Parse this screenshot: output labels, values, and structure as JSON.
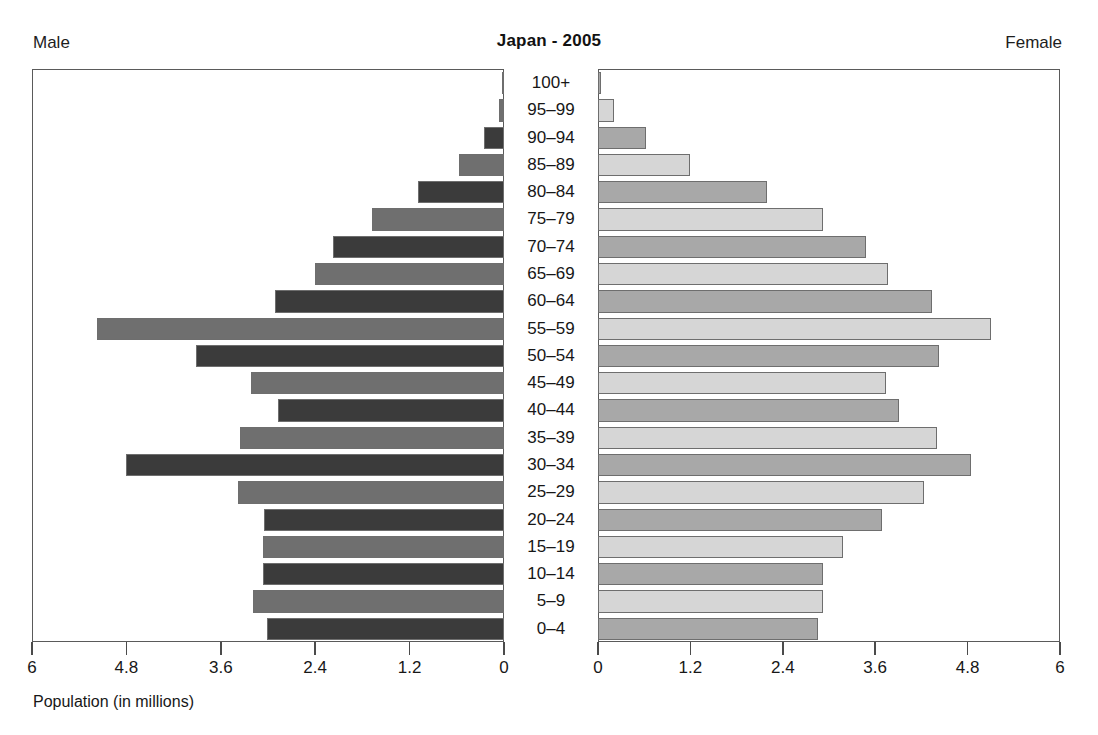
{
  "header": {
    "male_label": "Male",
    "female_label": "Female",
    "title": "Japan - 2005"
  },
  "axis": {
    "caption": "Population (in millions)",
    "male_ticks": [
      "6",
      "4.8",
      "3.6",
      "2.4",
      "1.2",
      "0"
    ],
    "female_ticks": [
      "0",
      "1.2",
      "2.4",
      "3.6",
      "4.8",
      "6"
    ],
    "max": 6,
    "tick_step": 1.2
  },
  "colors": {
    "male_dark": "#3b3b3b",
    "male_mid": "#6f6f6f",
    "female_mid": "#a8a8a8",
    "female_light": "#d6d6d6",
    "frame": "#5a5a5a",
    "text": "#171717",
    "background": "#ffffff"
  },
  "chart_data": {
    "type": "bar",
    "subtype": "population-pyramid",
    "title": "Japan - 2005",
    "xlabel": "Population (in millions)",
    "ylabel": "",
    "xlim": [
      0,
      6
    ],
    "xticks": [
      0,
      1.2,
      2.4,
      3.6,
      4.8,
      6
    ],
    "grid": false,
    "legend": false,
    "left_side_label": "Male",
    "right_side_label": "Female",
    "categories": [
      "100+",
      "95–99",
      "90–94",
      "85–89",
      "80–84",
      "75–79",
      "70–74",
      "65–69",
      "60–64",
      "55–59",
      "50–54",
      "45–49",
      "40–44",
      "35–39",
      "30–34",
      "25–29",
      "20–24",
      "15–19",
      "10–14",
      "5–9",
      "0–4"
    ],
    "series": [
      {
        "name": "Male",
        "side": "left",
        "values": [
          0.01,
          0.07,
          0.25,
          0.58,
          1.1,
          1.69,
          2.18,
          2.41,
          2.93,
          5.19,
          3.93,
          3.23,
          2.88,
          3.37,
          4.82,
          3.39,
          3.06,
          3.08,
          3.08,
          3.21,
          3.03
        ]
      },
      {
        "name": "Female",
        "side": "right",
        "values": [
          0.04,
          0.21,
          0.62,
          1.2,
          2.2,
          2.93,
          3.5,
          3.78,
          4.36,
          5.12,
          4.45,
          3.75,
          3.93,
          4.42,
          4.87,
          4.25,
          3.7,
          3.2,
          2.94,
          2.94,
          2.87
        ]
      }
    ]
  }
}
